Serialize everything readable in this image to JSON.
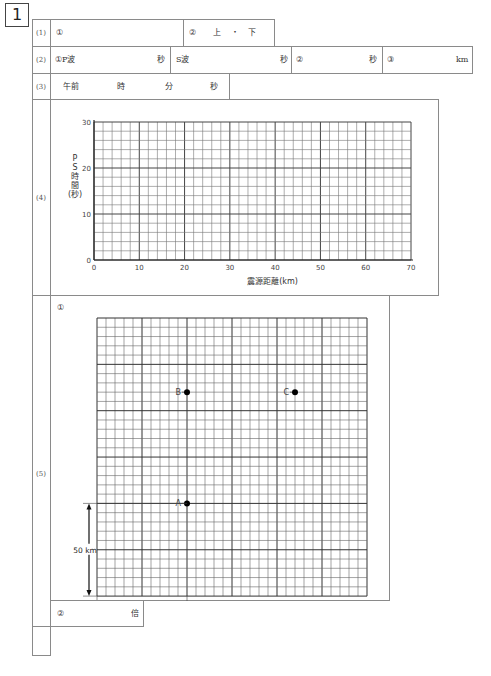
{
  "question_number": "1",
  "rows": {
    "r1": {
      "label": "(1)",
      "c1": "①",
      "c2_num": "②",
      "c2_opt1": "上",
      "c2_sep": "・",
      "c2_opt2": "下"
    },
    "r2": {
      "label": "(2)",
      "c1": "①P波",
      "c1_unit": "秒",
      "c2": "S波",
      "c2_unit": "秒",
      "c3": "②",
      "c3_unit": "秒",
      "c4": "③",
      "c4_unit": "km"
    },
    "r3": {
      "label": "(3)",
      "prefix": "午前",
      "u1": "時",
      "u2": "分",
      "u3": "秒"
    },
    "r4": {
      "label": "(4)"
    },
    "r5": {
      "label": "(5)",
      "sub1": "①",
      "sub2": "②",
      "sub2_unit": "倍",
      "points": [
        {
          "name": "B"
        },
        {
          "name": "C"
        },
        {
          "name": "A"
        }
      ],
      "scale_v": "50 km",
      "scale_h": "50 km"
    }
  },
  "chart_data": {
    "type": "scatter",
    "title": "",
    "xlabel": "震源距離(km)",
    "ylabel": "P-S時間(秒)",
    "ylabel_lines": [
      "P",
      "S",
      "時",
      "間",
      "(秒)"
    ],
    "xlim": [
      0,
      70
    ],
    "ylim": [
      0,
      30
    ],
    "xticks": [
      0,
      10,
      20,
      30,
      40,
      50,
      60,
      70
    ],
    "yticks": [
      0,
      10,
      20,
      30
    ],
    "x_minor_step": 2,
    "y_minor_step": 2,
    "grid": true,
    "series": []
  },
  "map_grid": {
    "cells_x": 30,
    "cells_y": 30,
    "km_per_cell": 5,
    "major_every": 5,
    "points": [
      {
        "name": "B",
        "col": 10,
        "row": 8
      },
      {
        "name": "C",
        "col": 22,
        "row": 8
      },
      {
        "name": "A",
        "col": 10,
        "row": 20
      }
    ]
  }
}
